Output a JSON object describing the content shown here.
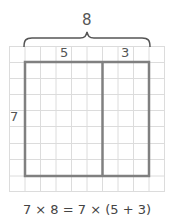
{
  "diagram": {
    "total_label": "8",
    "left_label": "5",
    "right_label": "3",
    "height_label": "7",
    "equation": "7 × 8 = 7 × (5 + 3)",
    "grid": {
      "cols": 10,
      "rows": 9
    },
    "rect": {
      "cols": 8,
      "rows": 7,
      "split_after_col": 5
    },
    "colors": {
      "grid": "#d9d9d9",
      "rect": "#808080",
      "brace": "#555555",
      "text": "#444444"
    }
  }
}
